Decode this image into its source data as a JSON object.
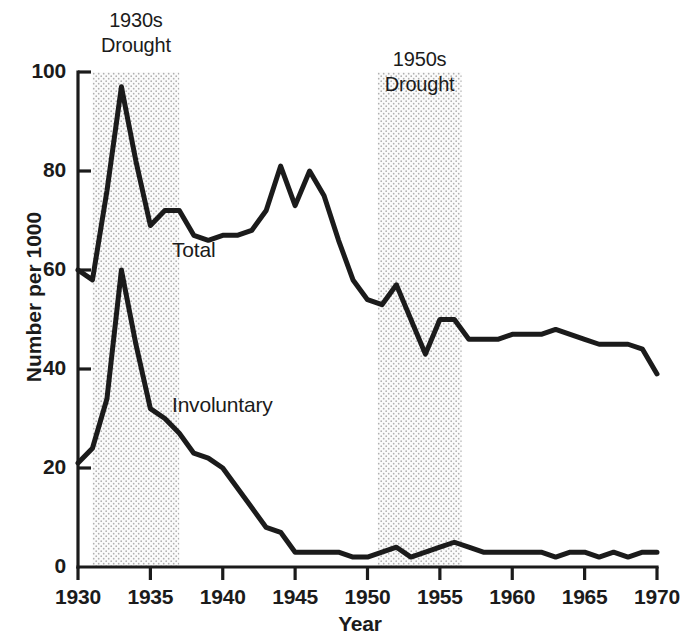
{
  "chart_data": {
    "type": "line",
    "title": "",
    "xlabel": "Year",
    "ylabel": "Number per 1000",
    "xlim": [
      1930,
      1970
    ],
    "ylim": [
      0,
      100
    ],
    "grid": false,
    "legend_position": "inline-annotation",
    "xticks": [
      1930,
      1935,
      1940,
      1945,
      1950,
      1955,
      1960,
      1965,
      1970
    ],
    "xtick_labels": [
      "1930",
      "1935",
      "1940",
      "1945",
      "1950",
      "1955",
      "1960",
      "1965",
      "1970"
    ],
    "yticks": [
      0,
      20,
      40,
      60,
      80,
      100
    ],
    "ytick_labels": [
      "0",
      "20",
      "40",
      "60",
      "80",
      "100"
    ],
    "line_color": "#1b1b1b",
    "shade_color": "#e6e6e6",
    "x": [
      1930,
      1931,
      1932,
      1933,
      1934,
      1935,
      1936,
      1937,
      1938,
      1939,
      1940,
      1941,
      1942,
      1943,
      1944,
      1945,
      1946,
      1947,
      1948,
      1949,
      1950,
      1951,
      1952,
      1953,
      1954,
      1955,
      1956,
      1957,
      1958,
      1959,
      1960,
      1961,
      1962,
      1963,
      1964,
      1965,
      1966,
      1967,
      1968,
      1969,
      1970
    ],
    "series": [
      {
        "name": "Total",
        "label": "Total",
        "values": [
          60,
          58,
          76,
          97,
          82,
          69,
          72,
          72,
          67,
          66,
          67,
          67,
          68,
          72,
          81,
          73,
          80,
          75,
          66,
          58,
          54,
          53,
          57,
          50,
          43,
          50,
          50,
          46,
          46,
          46,
          47,
          47,
          47,
          48,
          47,
          46,
          45,
          45,
          45,
          44,
          39
        ]
      },
      {
        "name": "Involuntary",
        "label": "Involuntary",
        "values": [
          21,
          24,
          34,
          60,
          45,
          32,
          30,
          27,
          23,
          22,
          20,
          16,
          12,
          8,
          7,
          3,
          3,
          3,
          3,
          2,
          2,
          3,
          4,
          2,
          3,
          4,
          5,
          4,
          3,
          3,
          3,
          3,
          3,
          2,
          3,
          3,
          2,
          3,
          2,
          3,
          3
        ]
      }
    ],
    "annotations": [
      {
        "id": "drought-1930s",
        "label_line1": "1930s",
        "label_line2": "Drought",
        "x_start": 1931,
        "x_end": 1937,
        "type": "shaded-band"
      },
      {
        "id": "drought-1950s",
        "label_line1": "1950s",
        "label_line2": "Drought",
        "x_start": 1950.7,
        "x_end": 1956.5,
        "type": "shaded-band"
      }
    ]
  }
}
